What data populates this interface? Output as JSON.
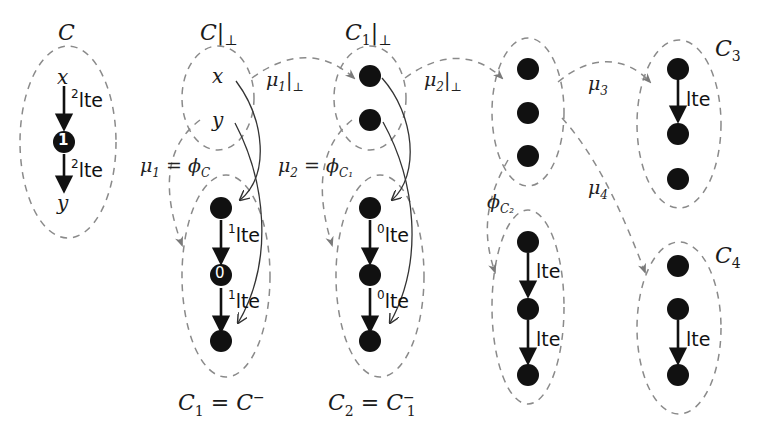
{
  "diagram": {
    "colors": {
      "node": "#111111",
      "dashed": "#888888",
      "arrow_dashed": "#7a7a7a",
      "edge": "#111111",
      "thin_edge": "#333333"
    },
    "clusters": [
      {
        "id": "C",
        "caption": "C",
        "caption_sub": "",
        "caption_suffix": "",
        "nodes": [
          "x",
          "1",
          "y"
        ],
        "edges": [
          "²lte",
          "²lte"
        ]
      },
      {
        "id": "C|⊥",
        "caption": "C|",
        "caption_sub": "⊥",
        "nodes": [
          "x",
          "y"
        ]
      },
      {
        "id": "C1|⊥",
        "caption": "C",
        "caption_sub": "1",
        "caption_suffix": "|⊥",
        "nodes": [
          "•",
          "•"
        ]
      },
      {
        "id": "C1",
        "caption": "C₁ = C⁻",
        "nodes": [
          "•",
          "0",
          "•"
        ],
        "edges": [
          "¹lte",
          "¹lte"
        ]
      },
      {
        "id": "C2",
        "caption": "C₂ = C₁⁻",
        "nodes": [
          "•",
          "•",
          "•"
        ],
        "edges": [
          "⁰lte",
          "⁰lte"
        ]
      },
      {
        "id": "C2|⊥",
        "nodes": [
          "•",
          "•",
          "•"
        ]
      },
      {
        "id": "phiC2-target",
        "nodes": [
          "•",
          "•",
          "•"
        ],
        "edges": [
          "lte",
          "lte"
        ]
      },
      {
        "id": "C3",
        "caption": "C",
        "caption_sub": "3",
        "nodes": [
          "•",
          "•",
          "•"
        ],
        "edges": [
          "lte"
        ]
      },
      {
        "id": "C4",
        "caption": "C",
        "caption_sub": "4",
        "nodes": [
          "•",
          "•",
          "•"
        ],
        "edges": [
          "lte"
        ]
      }
    ],
    "labels": {
      "C": "C",
      "C_bot": {
        "base": "C|",
        "sub": "⊥"
      },
      "C1_bot": {
        "base": "C",
        "sub": "1",
        "suffix": "|",
        "suffix_sub": "⊥"
      },
      "C3": {
        "base": "C",
        "sub": "3"
      },
      "C4": {
        "base": "C",
        "sub": "4"
      },
      "C1_eq": {
        "lhs": "C",
        "lhs_sub": "1",
        "eq": " = ",
        "rhs": "C",
        "rhs_sup": "−"
      },
      "C2_eq": {
        "lhs": "C",
        "lhs_sub": "2",
        "eq": " = ",
        "rhs": "C",
        "rhs_sub": "1",
        "rhs_sup": "−"
      },
      "x": "x",
      "y": "y",
      "node_1": "1",
      "node_0": "0"
    },
    "maps": {
      "mu1_bot": {
        "base": "μ",
        "sub": "1",
        "suffix": "|",
        "suffix_sub": "⊥"
      },
      "mu2_bot": {
        "base": "μ",
        "sub": "2",
        "suffix": "|",
        "suffix_sub": "⊥"
      },
      "mu1_phiC": {
        "lhs": "μ",
        "lhs_sub": "1",
        "eq": " = ",
        "rhs": "ϕ",
        "rhs_sub": "C"
      },
      "mu2_phiC1": {
        "lhs": "μ",
        "lhs_sub": "2",
        "eq": " = ",
        "rhs": "ϕ",
        "rhs_sub": "C₁"
      },
      "phiC2": {
        "base": "ϕ",
        "sub": "C₂"
      },
      "mu3": {
        "base": "μ",
        "sub": "3"
      },
      "mu4": {
        "base": "μ",
        "sub": "4"
      }
    },
    "edge_labels": {
      "C_e1": {
        "sup": "2",
        "text": "lte"
      },
      "C_e2": {
        "sup": "2",
        "text": "lte"
      },
      "C1_e1": {
        "sup": "1",
        "text": "lte"
      },
      "C1_e2": {
        "sup": "1",
        "text": "lte"
      },
      "C2_e1": {
        "sup": "0",
        "text": "lte"
      },
      "C2_e2": {
        "sup": "0",
        "text": "lte"
      },
      "P_e1": {
        "sup": "",
        "text": "lte"
      },
      "P_e2": {
        "sup": "",
        "text": "lte"
      },
      "C3_e1": {
        "sup": "",
        "text": "lte"
      },
      "C4_e1": {
        "sup": "",
        "text": "lte"
      }
    }
  }
}
